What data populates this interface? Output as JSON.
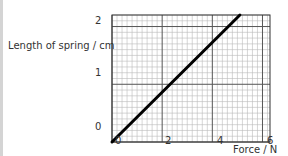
{
  "chart_data": {
    "type": "line",
    "title": "",
    "xlabel": "Force / N",
    "ylabel": "Length of spring / cm",
    "xlim": [
      0,
      6.3
    ],
    "ylim": [
      0,
      2.2
    ],
    "x_ticks": [
      "0",
      "2",
      "4",
      "6"
    ],
    "y_ticks": [
      "0",
      "1",
      "2"
    ],
    "grid": true,
    "legend": null,
    "series": [
      {
        "name": "spring",
        "x": [
          0,
          5.1
        ],
        "y": [
          0,
          2.2
        ]
      }
    ]
  },
  "labels": {
    "ylabel": "Length of spring / cm",
    "xlabel": "Force / N",
    "y0": "0",
    "y1": "1",
    "y2": "2",
    "x0": "0",
    "x2": "2",
    "x4": "4",
    "x6": "6"
  }
}
